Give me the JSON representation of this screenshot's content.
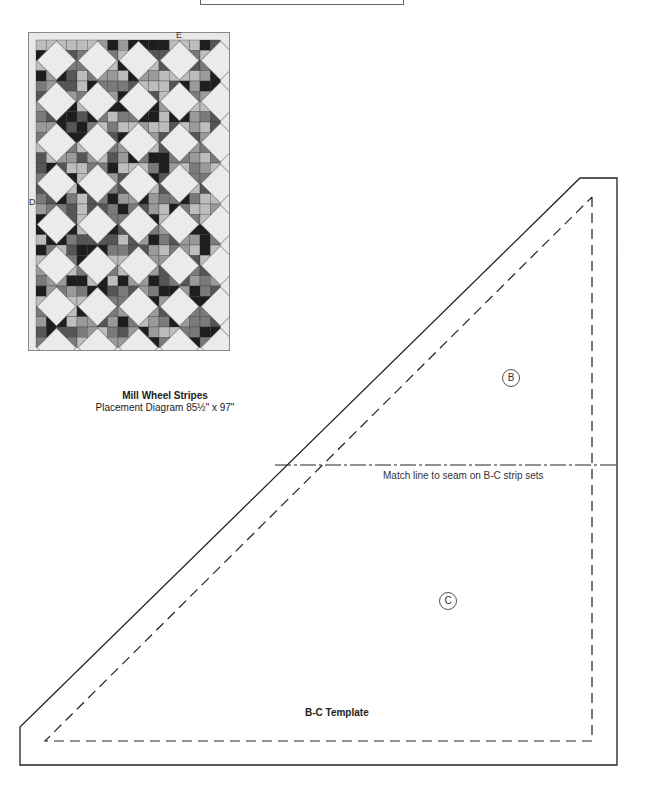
{
  "quilt": {
    "label_top": "E",
    "label_side": "D",
    "title": "Mill Wheel Stripes",
    "subtitle": "Placement Diagram 85½\" x 97\"",
    "colors": {
      "border": "#e9e9e9",
      "diamond": "#ebebeb",
      "dark": "#1e1e1e",
      "mid": "#7a7a7a",
      "light": "#bdbdbd"
    }
  },
  "template": {
    "title": "B-C Template",
    "match_line_label": "Match line to seam on B-C strip sets",
    "piece_b": "B",
    "piece_c": "C"
  }
}
